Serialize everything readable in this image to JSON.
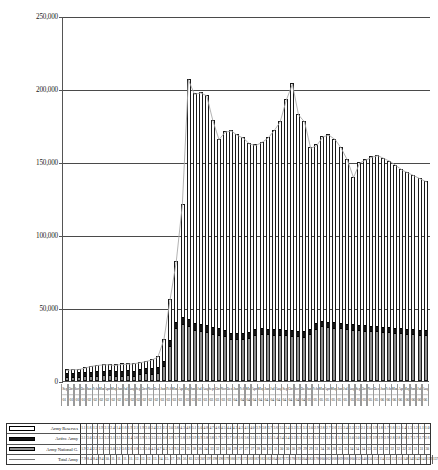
{
  "chart_data": {
    "type": "bar",
    "title": "",
    "subtitle": "",
    "xlabel": "",
    "ylabel": "",
    "ylim": [
      0,
      250000
    ],
    "yticks": [
      0,
      50000,
      100000,
      150000,
      200000,
      250000
    ],
    "ytick_labels": [
      "0",
      "50,000",
      "100,000",
      "150,000",
      "200,000",
      "250,000"
    ],
    "grid": true,
    "stacked": true,
    "legend_position": "bottom-table",
    "categories": [
      "Sep 01",
      "Oct 01",
      "Nov 01",
      "Dec 01",
      "Jan 02",
      "Feb 02",
      "Mar 02",
      "Apr 02",
      "May 02",
      "Jun 02",
      "Jul 02",
      "Aug 02",
      "Sep 02",
      "Oct 02",
      "Nov 02",
      "Dec 02",
      "Jan 03",
      "Feb 03",
      "Mar 03",
      "Apr 03",
      "May 03",
      "Jun 03",
      "Jul 03",
      "Aug 03",
      "Sep 03",
      "Oct 03",
      "Nov 03",
      "Dec 03",
      "Jan 04",
      "Feb 04",
      "Mar 04",
      "Apr 04",
      "May 04",
      "Jun 04",
      "Jul 04",
      "Aug 04",
      "Sep 04",
      "Oct 04",
      "Nov 04",
      "Dec 04",
      "Jan 05",
      "Feb 05",
      "Mar 05",
      "Apr 05",
      "May 05",
      "Jun 05",
      "Jul 05",
      "Aug 05",
      "Sep 05",
      "Oct 05",
      "Nov 05",
      "Dec 05",
      "Jan 06",
      "Feb 06",
      "Mar 06",
      "Apr 06",
      "May 06",
      "Jun 06",
      "Jul 06",
      "Aug 06"
    ],
    "months": [
      "Sep",
      "Oct",
      "Nov",
      "Dec",
      "Jan",
      "Feb",
      "Mar",
      "Apr",
      "May",
      "Jun",
      "Jul",
      "Aug",
      "Sep",
      "Oct",
      "Nov",
      "Dec",
      "Jan",
      "Feb",
      "Mar",
      "Apr",
      "May",
      "Jun",
      "Jul",
      "Aug",
      "Sep",
      "Oct",
      "Nov",
      "Dec",
      "Jan",
      "Feb",
      "Mar",
      "Apr",
      "May",
      "Jun",
      "Jul",
      "Aug",
      "Sep",
      "Oct",
      "Nov",
      "Dec",
      "Jan",
      "Feb",
      "Mar",
      "Apr",
      "May",
      "Jun",
      "Jul",
      "Aug",
      "Sep",
      "Oct",
      "Nov",
      "Dec",
      "Jan",
      "Feb",
      "Mar",
      "Apr",
      "May",
      "Jun",
      "Jul",
      "Aug"
    ],
    "years": [
      "01",
      "01",
      "01",
      "01",
      "02",
      "02",
      "02",
      "02",
      "02",
      "02",
      "02",
      "02",
      "02",
      "02",
      "02",
      "02",
      "03",
      "03",
      "03",
      "03",
      "03",
      "03",
      "03",
      "03",
      "03",
      "03",
      "03",
      "03",
      "04",
      "04",
      "04",
      "04",
      "04",
      "04",
      "04",
      "04",
      "04",
      "04",
      "04",
      "04",
      "05",
      "05",
      "05",
      "05",
      "05",
      "05",
      "05",
      "05",
      "05",
      "05",
      "05",
      "05",
      "06",
      "06",
      "06",
      "06",
      "06",
      "06",
      "06",
      "06"
    ],
    "series": [
      {
        "name": "Army National Guard",
        "color": "#8e8e8e",
        "stack_order": 0,
        "values": [
          1940,
          2460,
          2540,
          2500,
          2590,
          3080,
          3270,
          3600,
          2640,
          2830,
          3330,
          3040,
          4280,
          4750,
          4510,
          5290,
          9510,
          23900,
          35800,
          38800,
          36900,
          34200,
          33500,
          32800,
          31500,
          30900,
          29700,
          27800,
          27900,
          27600,
          28300,
          30500,
          31300,
          31000,
          30800,
          30700,
          30300,
          29900,
          29600,
          29300,
          31200,
          34900,
          36600,
          36100,
          35700,
          35200,
          34800,
          34400,
          34100,
          33800,
          33500,
          33200,
          32900,
          32600,
          32300,
          32000,
          31700,
          31400,
          31100,
          30800
        ]
      },
      {
        "name": "Active Army",
        "color": "#151515",
        "stack_order": 1,
        "values": [
          3120,
          3080,
          3270,
          3300,
          3220,
          3160,
          3340,
          3520,
          3420,
          3680,
          3910,
          3520,
          3530,
          3570,
          3680,
          3960,
          3720,
          3800,
          3900,
          3960,
          3910,
          3850,
          3820,
          3790,
          3760,
          3720,
          3690,
          3650,
          3620,
          3590,
          3560,
          3530,
          3500,
          3470,
          3440,
          3410,
          3380,
          3350,
          3320,
          3290,
          3260,
          3230,
          3200,
          3170,
          3140,
          3110,
          3080,
          3050,
          3020,
          2990,
          2960,
          2930,
          2900,
          2870,
          2840,
          2810,
          2780,
          2750,
          2720,
          2690
        ]
      },
      {
        "name": "Army Reserves",
        "color": "#ffffff",
        "stack_order": 2,
        "values": [
          1100,
          1670,
          1500,
          1900,
          2100,
          2400,
          1460,
          1670,
          1920,
          2100,
          1900,
          2020,
          2440,
          2340,
          2570,
          3040,
          3800,
          4300,
          4800,
          5100,
          5000,
          4800,
          4700,
          4600,
          4500,
          4400,
          4300,
          4200,
          4100,
          4000,
          3900,
          3800,
          3700,
          3600,
          3500,
          3400,
          3300,
          3200,
          3100,
          3000,
          2900,
          2800,
          2700,
          2600,
          2500,
          2400,
          2300,
          2200,
          2100,
          2000,
          1900,
          1800,
          1700,
          1600,
          1500,
          1400,
          1300,
          1200,
          1100,
          1000
        ]
      }
    ],
    "totals": [
      7900,
      8440,
      8430,
      9400,
      10600,
      11200,
      11700,
      11800,
      11400,
      12000,
      12200,
      12500,
      13100,
      14000,
      15000,
      17000,
      28900,
      56000,
      82000,
      121000,
      207000,
      197000,
      198000,
      196000,
      179000,
      166000,
      171000,
      172000,
      169000,
      167000,
      163000,
      162000,
      164000,
      167000,
      172000,
      178000,
      193000,
      204000,
      183000,
      178000,
      160000,
      162000,
      168000,
      169000,
      166000,
      160000,
      152000,
      140000,
      150000,
      152000,
      154000,
      155000,
      153000,
      151000,
      148000,
      145000,
      143000,
      141000,
      139000,
      137000
    ],
    "total_line": {
      "name": "Total Army",
      "color": "#aaaaaa",
      "style": "thin-line-with-markers"
    }
  },
  "legend": {
    "rows": [
      {
        "label": "Army Reserves",
        "swatch": "swatch-reserves",
        "values": [
          "1.1",
          "1.6",
          "1.5",
          "1.9",
          "2.1",
          "2.4",
          "1.4",
          "1.6",
          "1.9",
          "2.1",
          "1.9",
          "2.0",
          "2.4",
          "2.3",
          "2.5",
          "3.0",
          "3.8",
          "4.3",
          "4.8",
          "5.1",
          "5.0",
          "4.8",
          "4.7",
          "4.6",
          "4.5",
          "4.4",
          "4.3",
          "4.2",
          "4.1",
          "4.0",
          "3.9",
          "3.8",
          "3.7",
          "3.6",
          "3.5",
          "3.4",
          "3.3",
          "3.2",
          "3.1",
          "3.0",
          "2.9",
          "2.8",
          "2.7",
          "2.6",
          "2.5",
          "2.4",
          "2.3",
          "2.2",
          "2.1",
          "2.0",
          "1.9",
          "1.8",
          "1.7",
          "1.6",
          "1.5",
          "1.4",
          "1.3",
          "1.2",
          "1.1",
          "1.0"
        ]
      },
      {
        "label": "Active Army",
        "swatch": "swatch-active",
        "values": [
          "3.1",
          "3.0",
          "3.2",
          "3.3",
          "3.2",
          "3.1",
          "3.3",
          "3.5",
          "3.4",
          "3.6",
          "3.9",
          "3.5",
          "3.5",
          "3.5",
          "3.6",
          "3.9",
          "3.7",
          "3.8",
          "3.9",
          "3.9",
          "3.9",
          "3.8",
          "3.8",
          "3.7",
          "3.7",
          "3.7",
          "3.6",
          "3.6",
          "3.6",
          "3.5",
          "3.5",
          "3.5",
          "3.5",
          "3.4",
          "3.4",
          "3.4",
          "3.3",
          "3.3",
          "3.3",
          "3.2",
          "3.2",
          "3.2",
          "3.2",
          "3.1",
          "3.1",
          "3.1",
          "3.0",
          "3.0",
          "3.0",
          "2.9",
          "2.9",
          "2.9",
          "2.9",
          "2.8",
          "2.8",
          "2.8",
          "2.7",
          "2.7",
          "2.7",
          "2.6"
        ]
      },
      {
        "label": "Army National G.",
        "swatch": "swatch-nationalguard",
        "values": [
          "1.9",
          "2.4",
          "2.5",
          "2.5",
          "2.5",
          "3.0",
          "3.2",
          "3.6",
          "2.6",
          "2.8",
          "3.3",
          "3.0",
          "4.2",
          "4.7",
          "4.5",
          "5.2",
          "9.5",
          "23",
          "35",
          "38",
          "36",
          "34",
          "33",
          "32",
          "31",
          "30",
          "29",
          "27",
          "27",
          "27",
          "28",
          "30",
          "31",
          "31",
          "30",
          "30",
          "30",
          "29",
          "29",
          "29",
          "31",
          "34",
          "36",
          "36",
          "35",
          "35",
          "34",
          "34",
          "34",
          "33",
          "33",
          "33",
          "32",
          "32",
          "32",
          "32",
          "31",
          "31",
          "31",
          "30"
        ]
      },
      {
        "label": "Total Army",
        "swatch": "swatch-total",
        "values": [
          "7.9",
          "8.4",
          "8.4",
          "9.4",
          "10.",
          "11.",
          "11.",
          "11.",
          "11.",
          "12.",
          "12.",
          "12.",
          "13.",
          "14.",
          "15.",
          "17.",
          "28.",
          "56.",
          "82.",
          "121",
          "207",
          "197",
          "198",
          "196",
          "179",
          "166",
          "171",
          "172",
          "169",
          "167",
          "163",
          "162",
          "164",
          "167",
          "172",
          "178",
          "193",
          "204",
          "183",
          "178",
          "160",
          "162",
          "168",
          "169",
          "166",
          "160",
          "152",
          "140",
          "150",
          "152",
          "154",
          "155",
          "153",
          "151",
          "148",
          "145",
          "143",
          "141",
          "139",
          "137"
        ]
      }
    ]
  }
}
